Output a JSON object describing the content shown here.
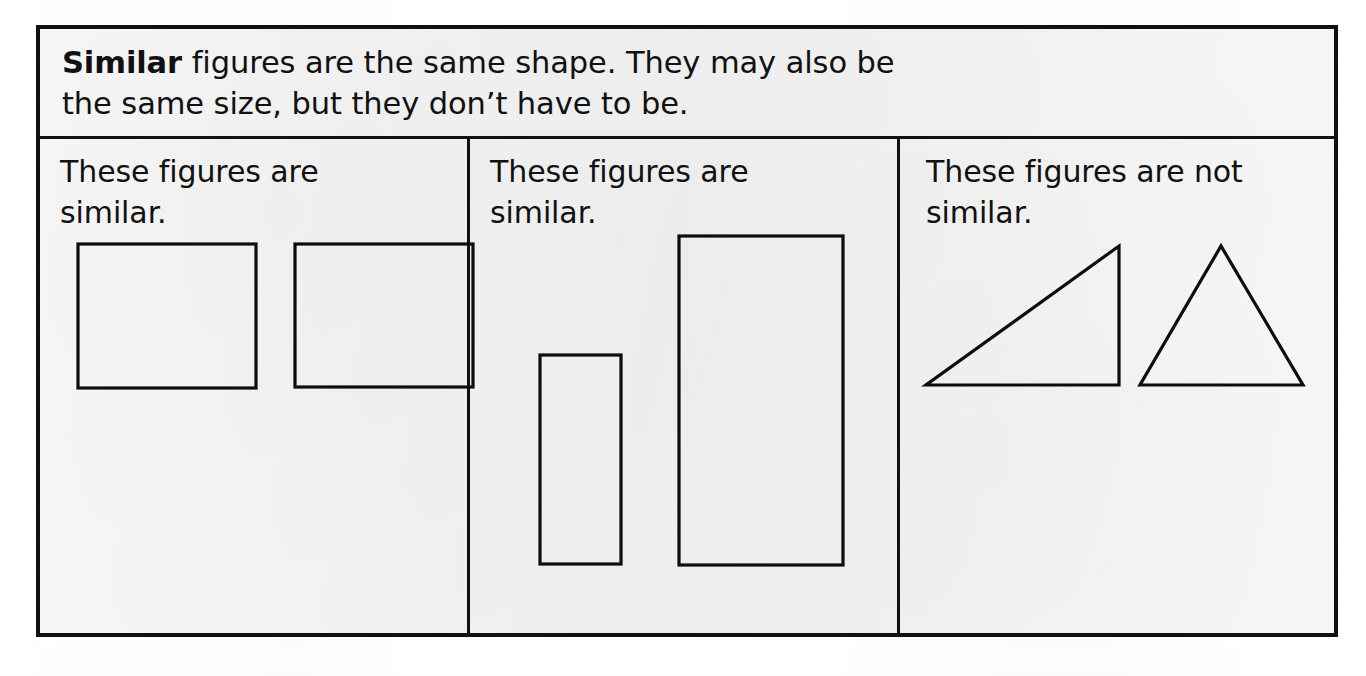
{
  "page": {
    "background_color": "#ffffff",
    "box_background_color": "#f1f1f1",
    "ink_color": "#111111"
  },
  "definition": {
    "term": "Similar",
    "line1_rest": " figures are the same shape. They may also be",
    "line2": "the same size, but they don’t have to be."
  },
  "columns": [
    {
      "id": "column-1",
      "caption": "These figures are\nsimilar.",
      "figures": [
        {
          "name": "rectangle-left",
          "kind": "rectangle",
          "x": 18,
          "y": 11,
          "width": 178,
          "height": 144
        },
        {
          "name": "rectangle-right",
          "kind": "rectangle",
          "x": 235,
          "y": 11,
          "width": 178,
          "height": 143
        }
      ]
    },
    {
      "id": "column-2",
      "caption": "These figures are\nsimilar.",
      "figures": [
        {
          "name": "rectangle-small",
          "kind": "rectangle",
          "x": 50,
          "y": 122,
          "width": 81,
          "height": 209
        },
        {
          "name": "rectangle-large",
          "kind": "rectangle",
          "x": 189,
          "y": 3,
          "width": 164,
          "height": 329
        }
      ]
    },
    {
      "id": "column-3",
      "caption": "These figures are not\nsimilar.",
      "figures": [
        {
          "name": "triangle-right",
          "kind": "triangle",
          "points": "0,152 193,152 193,13"
        },
        {
          "name": "triangle-isosceles",
          "kind": "triangle",
          "points": "214,152 377,152 295,13"
        }
      ]
    }
  ]
}
